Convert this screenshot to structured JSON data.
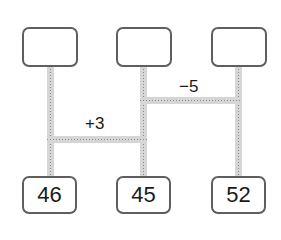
{
  "diagram": {
    "type": "amida-ladder",
    "top_boxes": [
      {
        "value": ""
      },
      {
        "value": ""
      },
      {
        "value": ""
      }
    ],
    "bottom_boxes": [
      {
        "value": "46"
      },
      {
        "value": "45"
      },
      {
        "value": "52"
      }
    ],
    "connectors": [
      {
        "label": "+3",
        "between": [
          "column-1",
          "column-2"
        ]
      },
      {
        "label": "−5",
        "between": [
          "column-2",
          "column-3"
        ]
      }
    ]
  }
}
